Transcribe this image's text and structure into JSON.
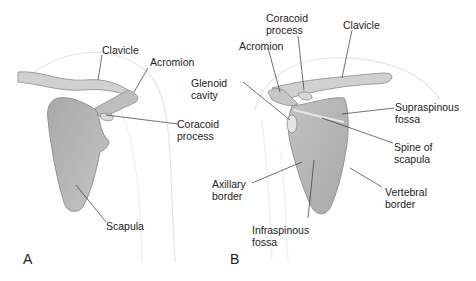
{
  "figure": {
    "panels": [
      {
        "id": "A",
        "letter": "A",
        "labels": {
          "clavicle": [
            "Clavicle"
          ],
          "acromion": [
            "Acromion"
          ],
          "coracoid": [
            "Coracoid",
            "process"
          ],
          "scapula": [
            "Scapula"
          ]
        }
      },
      {
        "id": "B",
        "letter": "B",
        "labels": {
          "coracoid": [
            "Coracoid",
            "process"
          ],
          "clavicle": [
            "Clavicle"
          ],
          "acromion": [
            "Acromion"
          ],
          "glenoid": [
            "Glenoid",
            "cavity"
          ],
          "supraspinous": [
            "Supraspinous",
            "fossa"
          ],
          "spine": [
            "Spine of",
            "scapula"
          ],
          "axillary": [
            "Axillary",
            "border"
          ],
          "vertebral": [
            "Vertebral",
            "border"
          ],
          "infraspinous": [
            "Infraspinous",
            "fossa"
          ]
        }
      }
    ],
    "colors": {
      "bone_fill": "#b5b5b5",
      "bone_light": "#d6d6d6",
      "bone_edge": "#8c8c8c",
      "body_outline": "#e2e2e2",
      "leader_line": "#333333",
      "text": "#222222"
    }
  }
}
